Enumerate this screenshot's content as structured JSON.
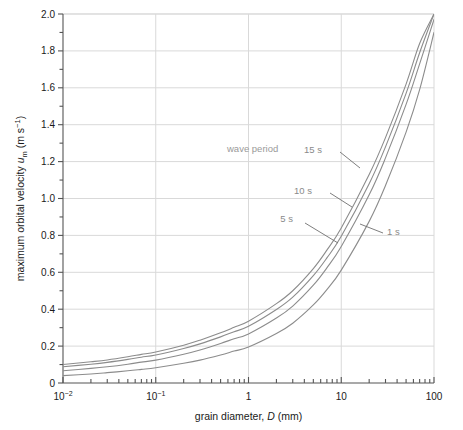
{
  "chart_data": {
    "type": "line",
    "title": "",
    "xlabel": "grain diameter, D (mm)",
    "ylabel": "maximum orbital velocity u_m (m s^-1)",
    "xscale": "log",
    "yscale": "linear",
    "xlim": [
      0.01,
      100
    ],
    "ylim": [
      0,
      2.0
    ],
    "grid": true,
    "legend_position": "inline-annotations",
    "annotations": [
      {
        "text": "wave period",
        "x_px": 227,
        "y_px": 152
      },
      {
        "text": "15 s",
        "x_px": 322,
        "y_px": 153
      },
      {
        "text": "10 s",
        "x_px": 312,
        "y_px": 194
      },
      {
        "text": "5 s",
        "x_px": 293,
        "y_px": 222
      },
      {
        "text": "1 s",
        "x_px": 387,
        "y_px": 235
      }
    ],
    "xticks_major": [
      {
        "value": 0.01,
        "label": "10",
        "sup": "-2"
      },
      {
        "value": 0.1,
        "label": "10",
        "sup": "-1"
      },
      {
        "value": 1,
        "label": "1",
        "sup": ""
      },
      {
        "value": 10,
        "label": "10",
        "sup": ""
      },
      {
        "value": 100,
        "label": "100",
        "sup": ""
      }
    ],
    "yticks_major": [
      0,
      0.2,
      0.4,
      0.6,
      0.8,
      1.0,
      1.2,
      1.4,
      1.6,
      1.8,
      2.0
    ],
    "yticks_major_labels": [
      "0",
      "0.2",
      "0.4",
      "0.6",
      "0.8",
      "1.0",
      "1.2",
      "1.4",
      "1.6",
      "1.8",
      "2.0"
    ],
    "yticks_minor": [
      0.1,
      0.3,
      0.5,
      0.7,
      0.9,
      1.1,
      1.3,
      1.5,
      1.7,
      1.9
    ],
    "series": [
      {
        "name": "15 s",
        "x": [
          0.01,
          0.02,
          0.03,
          0.05,
          0.07,
          0.1,
          0.2,
          0.3,
          0.5,
          0.7,
          1,
          2,
          3,
          5,
          7,
          10,
          20,
          30,
          50,
          70,
          100
        ],
        "y": [
          0.1,
          0.115,
          0.125,
          0.142,
          0.155,
          0.168,
          0.205,
          0.232,
          0.272,
          0.302,
          0.335,
          0.43,
          0.5,
          0.62,
          0.72,
          0.84,
          1.13,
          1.33,
          1.62,
          1.84,
          2.0
        ]
      },
      {
        "name": "10 s",
        "x": [
          0.01,
          0.02,
          0.03,
          0.05,
          0.07,
          0.1,
          0.2,
          0.3,
          0.5,
          0.7,
          1,
          2,
          3,
          5,
          7,
          10,
          20,
          30,
          50,
          70,
          100
        ],
        "y": [
          0.088,
          0.102,
          0.112,
          0.128,
          0.14,
          0.152,
          0.187,
          0.212,
          0.25,
          0.278,
          0.307,
          0.398,
          0.465,
          0.582,
          0.678,
          0.795,
          1.08,
          1.28,
          1.57,
          1.79,
          2.0
        ]
      },
      {
        "name": "5 s",
        "x": [
          0.01,
          0.02,
          0.03,
          0.05,
          0.07,
          0.1,
          0.2,
          0.3,
          0.5,
          0.7,
          1,
          2,
          3,
          5,
          7,
          10,
          20,
          30,
          50,
          70,
          100
        ],
        "y": [
          0.066,
          0.079,
          0.088,
          0.102,
          0.113,
          0.124,
          0.156,
          0.179,
          0.214,
          0.24,
          0.266,
          0.352,
          0.417,
          0.53,
          0.624,
          0.74,
          1.02,
          1.22,
          1.51,
          1.73,
          1.97
        ]
      },
      {
        "name": "1 s",
        "x": [
          0.01,
          0.02,
          0.03,
          0.05,
          0.07,
          0.1,
          0.2,
          0.3,
          0.5,
          0.7,
          1,
          2,
          3,
          5,
          7,
          10,
          20,
          30,
          50,
          70,
          100
        ],
        "y": [
          0.04,
          0.049,
          0.056,
          0.066,
          0.074,
          0.083,
          0.107,
          0.124,
          0.152,
          0.173,
          0.195,
          0.268,
          0.324,
          0.423,
          0.506,
          0.612,
          0.876,
          1.07,
          1.36,
          1.59,
          1.9
        ]
      }
    ],
    "colors": {
      "curve": "#8c8c8c",
      "grid": "#d9d9d9",
      "axis": "#555555",
      "text": "#1a1a1a",
      "annotation": "#8a8a8a"
    }
  },
  "yaxis_title": {
    "prefix": "maximum orbital velocity ",
    "symbol": "u",
    "subscript": "m",
    "unit_open": " (m s",
    "unit_sup": "−1",
    "unit_close": ")"
  },
  "xaxis_title": {
    "prefix": "grain diameter, ",
    "symbol": "D",
    "suffix": " (mm)"
  }
}
